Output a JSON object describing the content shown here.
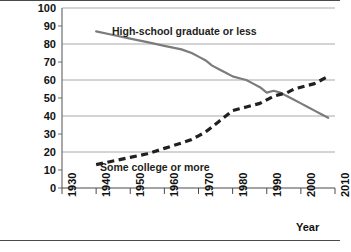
{
  "chart_data": {
    "type": "line",
    "title": "",
    "xlabel": "Year",
    "ylabel": "",
    "xlim": [
      1930,
      2010
    ],
    "ylim": [
      0,
      100
    ],
    "grid": true,
    "gridlines_y": [
      20,
      40,
      60,
      80,
      100
    ],
    "legend_position": "inline-labels",
    "x_ticks": [
      1930,
      1940,
      1950,
      1960,
      1970,
      1980,
      1990,
      2000,
      2010
    ],
    "x_tick_labels": [
      "1930",
      "1940",
      "1950",
      "1960",
      "1970",
      "1980",
      "1990",
      "2000",
      "2010"
    ],
    "y_ticks": [
      0,
      10,
      20,
      30,
      40,
      50,
      60,
      70,
      80,
      90,
      100
    ],
    "y_tick_labels": [
      "0",
      "10",
      "20",
      "30",
      "40",
      "50",
      "60",
      "70",
      "80",
      "90",
      "100"
    ],
    "series": [
      {
        "name": "High-school graduate or less",
        "style": "solid",
        "color": "#7b7b7b",
        "x": [
          1940,
          1945,
          1950,
          1955,
          1960,
          1965,
          1968,
          1970,
          1972,
          1974,
          1976,
          1978,
          1980,
          1982,
          1984,
          1986,
          1988,
          1990,
          1992,
          1994,
          1996,
          1998,
          2000,
          2002,
          2004,
          2006,
          2008
        ],
        "values": [
          87,
          85,
          83,
          81,
          79,
          77,
          75,
          73,
          71,
          68,
          66,
          64,
          62,
          61,
          60,
          58,
          56,
          53,
          54,
          53,
          51,
          49,
          47,
          45,
          43,
          41,
          39
        ]
      },
      {
        "name": "Some college or more",
        "style": "dashed",
        "color": "#231f20",
        "x": [
          1940,
          1945,
          1950,
          1955,
          1960,
          1965,
          1968,
          1970,
          1972,
          1974,
          1976,
          1978,
          1980,
          1982,
          1984,
          1986,
          1988,
          1990,
          1992,
          1994,
          1996,
          1998,
          2000,
          2002,
          2004,
          2006,
          2008
        ],
        "values": [
          13,
          15,
          17,
          19,
          22,
          25,
          27,
          29,
          31,
          34,
          37,
          40,
          43,
          44,
          45,
          46,
          47,
          49,
          51,
          52,
          53,
          55,
          56,
          57,
          58,
          60,
          62
        ]
      }
    ],
    "annotations": [
      {
        "text": "High-school graduate or less",
        "series": "High-school graduate or less"
      },
      {
        "text": "Some college or more",
        "series": "Some college or more"
      }
    ],
    "colors": {
      "solid_line": "#7b7b7b",
      "dashed_line": "#231f20",
      "gridline": "#a8a8a8",
      "axis": "#6d6d6d",
      "text": "#111111",
      "background": "#ffffff"
    }
  }
}
